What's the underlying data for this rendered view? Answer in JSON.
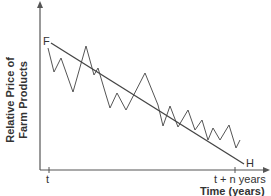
{
  "chart_data": {
    "type": "line",
    "title": "",
    "xlabel": "Time (years)",
    "ylabel": "Relative Price of Farm Products",
    "ylabel_lines": [
      "Relative Price of",
      "Farm Products"
    ],
    "x_ticks": [
      "t",
      "t + n years"
    ],
    "grid": false,
    "legend": null,
    "annotations": [
      {
        "label": "F",
        "position": "start of trend line"
      },
      {
        "label": "H",
        "position": "end of trend line"
      }
    ],
    "series": [
      {
        "name": "Actual relative price",
        "style": "zigzag",
        "points": [
          [
            48,
            48
          ],
          [
            54,
            72
          ],
          [
            61,
            58
          ],
          [
            73,
            92
          ],
          [
            86,
            46
          ],
          [
            94,
            75
          ],
          [
            98,
            68
          ],
          [
            106,
            95
          ],
          [
            110,
            108
          ],
          [
            117,
            93
          ],
          [
            126,
            110
          ],
          [
            145,
            73
          ],
          [
            158,
            105
          ],
          [
            163,
            126
          ],
          [
            170,
            106
          ],
          [
            178,
            127
          ],
          [
            188,
            110
          ],
          [
            195,
            130
          ],
          [
            202,
            120
          ],
          [
            208,
            140
          ],
          [
            213,
            128
          ],
          [
            220,
            140
          ],
          [
            229,
            125
          ],
          [
            236,
            148
          ],
          [
            240,
            140
          ]
        ]
      },
      {
        "name": "Trend line F-H",
        "style": "straight",
        "points": [
          [
            51,
            43
          ],
          [
            244,
            164
          ]
        ]
      }
    ]
  },
  "labels": {
    "ylabel_line1": "Relative Price of",
    "ylabel_line2": "Farm Products",
    "xlabel": "Time (years)",
    "tick_start": "t",
    "tick_end": "t + n years",
    "point_f": "F",
    "point_h": "H"
  }
}
